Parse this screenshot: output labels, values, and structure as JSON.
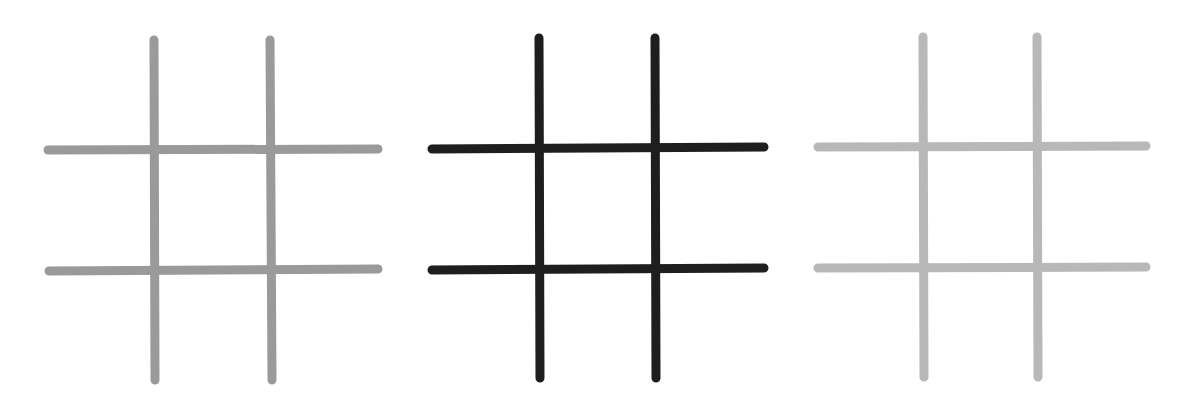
{
  "diagram": {
    "stroke_width": 9,
    "grids": [
      {
        "name": "grid-left",
        "color": "#9a9a9a",
        "vertical_lines": [
          {
            "x1": 154,
            "y1": 40,
            "x2": 155,
            "y2": 380
          },
          {
            "x1": 270,
            "y1": 40,
            "x2": 272,
            "y2": 380
          }
        ],
        "horizontal_lines": [
          {
            "x1": 48,
            "y1": 150,
            "x2": 378,
            "y2": 149
          },
          {
            "x1": 49,
            "y1": 271,
            "x2": 378,
            "y2": 269
          }
        ]
      },
      {
        "name": "grid-middle",
        "color": "#1e1e1e",
        "vertical_lines": [
          {
            "x1": 539,
            "y1": 38,
            "x2": 540,
            "y2": 378
          },
          {
            "x1": 655,
            "y1": 38,
            "x2": 656,
            "y2": 378
          }
        ],
        "horizontal_lines": [
          {
            "x1": 432,
            "y1": 149,
            "x2": 764,
            "y2": 147
          },
          {
            "x1": 432,
            "y1": 270,
            "x2": 764,
            "y2": 268
          }
        ]
      },
      {
        "name": "grid-right",
        "color": "#b8b8b8",
        "vertical_lines": [
          {
            "x1": 923,
            "y1": 37,
            "x2": 924,
            "y2": 377
          },
          {
            "x1": 1037,
            "y1": 37,
            "x2": 1038,
            "y2": 377
          }
        ],
        "horizontal_lines": [
          {
            "x1": 818,
            "y1": 147,
            "x2": 1146,
            "y2": 146
          },
          {
            "x1": 818,
            "y1": 268,
            "x2": 1146,
            "y2": 267
          }
        ]
      }
    ]
  }
}
